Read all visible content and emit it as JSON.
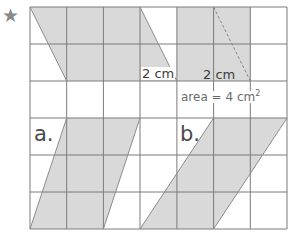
{
  "star": "★",
  "labels": {
    "dim1": "2 cm",
    "dim2": "2 cm",
    "area_text": "area = 4 cm",
    "area_sup": "2",
    "part_a": "a.",
    "part_b": "b."
  },
  "grid": {
    "columns": 7,
    "rows": 6,
    "cell_unit": "1 cm"
  },
  "shapes": [
    {
      "id": "example-parallelogram",
      "type": "parallelogram",
      "base_cm": 3,
      "height_cm": 2
    },
    {
      "id": "example-rectangle",
      "type": "rectangle",
      "width_cm": 2,
      "height_cm": 2,
      "area": "4 cm²"
    },
    {
      "id": "shape-a",
      "type": "parallelogram",
      "label": "a."
    },
    {
      "id": "shape-b",
      "type": "parallelogram",
      "label": "b."
    }
  ],
  "colors": {
    "shade": "#d9d9d9",
    "grid": "#7a7a7a",
    "dash": "#888888"
  }
}
